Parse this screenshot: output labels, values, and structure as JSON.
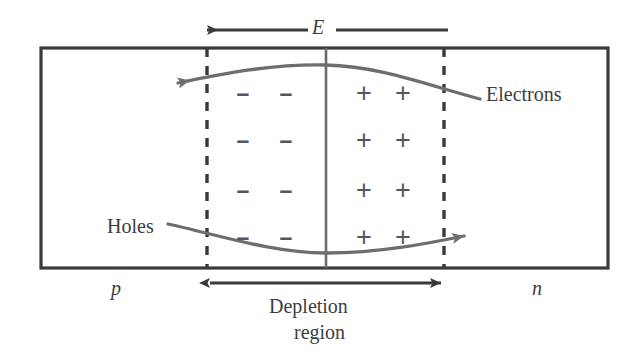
{
  "diagram": {
    "field_label": "E",
    "electrons_label": "Electrons",
    "holes_label": "Holes",
    "p_region_label": "p",
    "n_region_label": "n",
    "depletion_label_line1": "Depletion",
    "depletion_label_line2": "region",
    "minus_sign": "–",
    "plus_sign": "+",
    "charge_grid": {
      "rows": 4,
      "columns_per_side": 2,
      "negative_columns_x": [
        243,
        286
      ],
      "positive_columns_x": [
        364,
        403
      ],
      "rows_y": [
        93,
        140,
        190,
        237
      ]
    },
    "colors": {
      "outline": "#3a3a3a",
      "dashed_boundary": "#3a3a3a",
      "junction_line": "#6b6b6b",
      "carrier_curve": "#6e6e6e",
      "charge_sign": "#55565a",
      "text": "#3d3d3d",
      "background": "#ffffff"
    },
    "geometry": {
      "box_left": 41,
      "box_right": 608,
      "box_top": 48,
      "box_bottom": 268,
      "dashed_left_x": 207,
      "dashed_right_x": 444,
      "junction_x": 326,
      "field_arrow_y": 30,
      "field_arrow_from_x": 448,
      "field_arrow_to_x": 207,
      "depletion_arrow_y": 283
    }
  }
}
